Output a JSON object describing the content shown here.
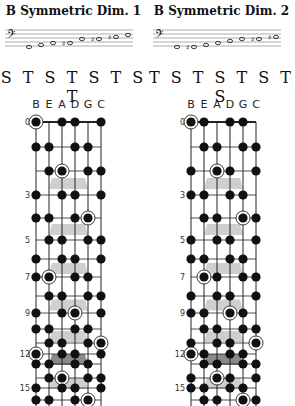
{
  "panels": [
    {
      "title": "B Symmetric Dim. 1",
      "pattern": "S T S T S T S T",
      "strings": [
        "B",
        "E",
        "A",
        "D",
        "G",
        "C"
      ],
      "staff": {
        "clef": "bass",
        "notes": [
          {
            "pos": 0,
            "acc": ""
          },
          {
            "pos": 1,
            "acc": ""
          },
          {
            "pos": 2,
            "acc": ""
          },
          {
            "pos": 2,
            "acc": "#"
          },
          {
            "pos": 4,
            "acc": ""
          },
          {
            "pos": 4,
            "acc": "#"
          },
          {
            "pos": 5,
            "acc": "#"
          },
          {
            "pos": 6,
            "acc": ""
          }
        ]
      },
      "fret_labels": [
        "0",
        "3",
        "5",
        "7",
        "9",
        "12",
        "15"
      ],
      "dots": [
        [
          0,
          0,
          "root"
        ],
        [
          0,
          2
        ],
        [
          0,
          3
        ],
        [
          0,
          5
        ],
        [
          1,
          0
        ],
        [
          1,
          1
        ],
        [
          1,
          3
        ],
        [
          1,
          4
        ],
        [
          2,
          1
        ],
        [
          2,
          2,
          "root"
        ],
        [
          2,
          4
        ],
        [
          2,
          5
        ],
        [
          3,
          0
        ],
        [
          3,
          2
        ],
        [
          3,
          3
        ],
        [
          3,
          5
        ],
        [
          4,
          0
        ],
        [
          4,
          1
        ],
        [
          4,
          3
        ],
        [
          4,
          4,
          "root"
        ],
        [
          5,
          1
        ],
        [
          5,
          2
        ],
        [
          5,
          4
        ],
        [
          5,
          5
        ],
        [
          6,
          0
        ],
        [
          6,
          2
        ],
        [
          6,
          3
        ],
        [
          6,
          5
        ],
        [
          7,
          0
        ],
        [
          7,
          1,
          "root"
        ],
        [
          7,
          3
        ],
        [
          7,
          4
        ],
        [
          8,
          1
        ],
        [
          8,
          2
        ],
        [
          8,
          4
        ],
        [
          8,
          5
        ],
        [
          9,
          0
        ],
        [
          9,
          2
        ],
        [
          9,
          3,
          "root"
        ],
        [
          9,
          5
        ],
        [
          10,
          0
        ],
        [
          10,
          1
        ],
        [
          10,
          3
        ],
        [
          10,
          4
        ],
        [
          11,
          1
        ],
        [
          11,
          2
        ],
        [
          11,
          4
        ],
        [
          11,
          5,
          "root"
        ],
        [
          12,
          0,
          "root"
        ],
        [
          12,
          2
        ],
        [
          12,
          3
        ],
        [
          12,
          5
        ],
        [
          13,
          0
        ],
        [
          13,
          1
        ],
        [
          13,
          3
        ],
        [
          13,
          4
        ],
        [
          14,
          1
        ],
        [
          14,
          2,
          "root"
        ],
        [
          14,
          4
        ],
        [
          14,
          5
        ],
        [
          15,
          0
        ],
        [
          15,
          2
        ],
        [
          15,
          3
        ],
        [
          15,
          5
        ],
        [
          16,
          0
        ],
        [
          16,
          1
        ],
        [
          16,
          3
        ],
        [
          16,
          4,
          "root"
        ]
      ]
    },
    {
      "title": "B Symmetric Dim. 2",
      "pattern": "T S T S T S T S",
      "strings": [
        "B",
        "E",
        "A",
        "D",
        "G",
        "C"
      ],
      "staff": {
        "clef": "bass",
        "notes": [
          {
            "pos": 0,
            "acc": ""
          },
          {
            "pos": 0,
            "acc": "#"
          },
          {
            "pos": 1,
            "acc": ""
          },
          {
            "pos": 2,
            "acc": ""
          },
          {
            "pos": 3,
            "acc": ""
          },
          {
            "pos": 4,
            "acc": ""
          },
          {
            "pos": 4,
            "acc": "#"
          },
          {
            "pos": 5,
            "acc": "#"
          }
        ]
      },
      "fret_labels": [
        "0",
        "3",
        "5",
        "7",
        "9",
        "12",
        "15"
      ],
      "dots": [
        [
          0,
          0,
          "root"
        ],
        [
          0,
          1
        ],
        [
          0,
          3
        ],
        [
          0,
          4
        ],
        [
          1,
          1
        ],
        [
          1,
          2
        ],
        [
          1,
          4
        ],
        [
          1,
          5
        ],
        [
          2,
          0
        ],
        [
          2,
          2,
          "root"
        ],
        [
          2,
          3
        ],
        [
          2,
          5
        ],
        [
          3,
          0
        ],
        [
          3,
          1
        ],
        [
          3,
          3
        ],
        [
          3,
          4
        ],
        [
          4,
          1
        ],
        [
          4,
          2
        ],
        [
          4,
          4,
          "root"
        ],
        [
          4,
          5
        ],
        [
          5,
          0
        ],
        [
          5,
          2
        ],
        [
          5,
          3
        ],
        [
          5,
          5
        ],
        [
          6,
          0
        ],
        [
          6,
          1
        ],
        [
          6,
          3
        ],
        [
          6,
          4
        ],
        [
          7,
          1,
          "root"
        ],
        [
          7,
          2
        ],
        [
          7,
          4
        ],
        [
          7,
          5
        ],
        [
          8,
          0
        ],
        [
          8,
          2
        ],
        [
          8,
          3
        ],
        [
          8,
          5
        ],
        [
          9,
          0
        ],
        [
          9,
          1
        ],
        [
          9,
          3,
          "root"
        ],
        [
          9,
          4
        ],
        [
          10,
          1
        ],
        [
          10,
          2
        ],
        [
          10,
          4
        ],
        [
          10,
          5
        ],
        [
          11,
          0
        ],
        [
          11,
          2
        ],
        [
          11,
          3
        ],
        [
          11,
          5,
          "root"
        ],
        [
          12,
          0,
          "root"
        ],
        [
          12,
          1
        ],
        [
          12,
          3
        ],
        [
          12,
          4
        ],
        [
          13,
          1
        ],
        [
          13,
          2
        ],
        [
          13,
          4
        ],
        [
          13,
          5
        ],
        [
          14,
          0
        ],
        [
          14,
          2,
          "root"
        ],
        [
          14,
          3
        ],
        [
          14,
          5
        ],
        [
          15,
          0
        ],
        [
          15,
          1
        ],
        [
          15,
          3
        ],
        [
          15,
          4
        ],
        [
          16,
          1
        ],
        [
          16,
          2
        ],
        [
          16,
          4,
          "root"
        ],
        [
          16,
          5
        ]
      ]
    }
  ]
}
